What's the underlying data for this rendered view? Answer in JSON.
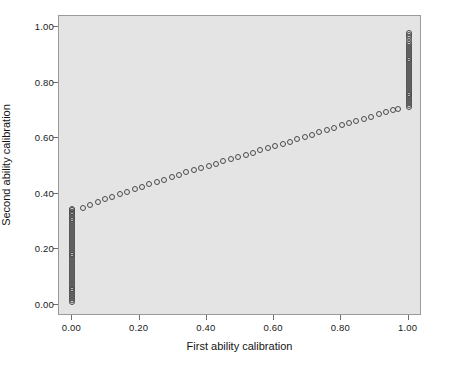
{
  "chart_data": {
    "type": "scatter",
    "title": "",
    "xlabel": "First ability calibration",
    "ylabel": "Second ability calibration",
    "xlim": [
      -0.04,
      1.04
    ],
    "ylim": [
      -0.04,
      1.04
    ],
    "xticks": [
      "0.00",
      "0.20",
      "0.40",
      "0.60",
      "0.80",
      "1.00"
    ],
    "xtick_values": [
      0.0,
      0.2,
      0.4,
      0.6,
      0.8,
      1.0
    ],
    "yticks": [
      "0.00",
      "0.20",
      "0.40",
      "0.60",
      "0.80",
      "1.00"
    ],
    "ytick_values": [
      0.0,
      0.2,
      0.4,
      0.6,
      0.8,
      1.0
    ],
    "grid": false,
    "legend": null,
    "marker": "open-circle",
    "marker_color": "#4a4a4a",
    "plot_background": "#e4e4e4",
    "page_background": "#ffffff",
    "border_color": "#9a9a9a",
    "series": [
      {
        "name": "Left floor cluster",
        "comment": "dense vertical column of examinees pinned at x = 0.00",
        "x": [
          0.0,
          0.0,
          0.0,
          0.0,
          0.0,
          0.0,
          0.0,
          0.0,
          0.0,
          0.0,
          0.0,
          0.0,
          0.0,
          0.0,
          0.0,
          0.0,
          0.0,
          0.0,
          0.0,
          0.0,
          0.0,
          0.0,
          0.0,
          0.0,
          0.0,
          0.0,
          0.0,
          0.0,
          0.0,
          0.0,
          0.0,
          0.0,
          0.0,
          0.0,
          0.0,
          0.0,
          0.0,
          0.0,
          0.0,
          0.0,
          0.0,
          0.0,
          0.0,
          0.0,
          0.0,
          0.0,
          0.0,
          0.0,
          0.0,
          0.0
        ],
        "y": [
          0.01,
          0.017,
          0.024,
          0.031,
          0.038,
          0.045,
          0.052,
          0.059,
          0.066,
          0.073,
          0.08,
          0.087,
          0.094,
          0.101,
          0.108,
          0.115,
          0.122,
          0.129,
          0.136,
          0.143,
          0.15,
          0.157,
          0.164,
          0.171,
          0.178,
          0.185,
          0.192,
          0.199,
          0.206,
          0.213,
          0.22,
          0.227,
          0.234,
          0.241,
          0.248,
          0.255,
          0.262,
          0.269,
          0.276,
          0.283,
          0.29,
          0.297,
          0.304,
          0.311,
          0.318,
          0.325,
          0.33,
          0.335,
          0.34,
          0.345
        ]
      },
      {
        "name": "Central diagonal band",
        "comment": "monotone rising trace of matched calibrations",
        "x": [
          0.03,
          0.053,
          0.075,
          0.097,
          0.119,
          0.141,
          0.163,
          0.185,
          0.207,
          0.229,
          0.251,
          0.273,
          0.295,
          0.317,
          0.339,
          0.361,
          0.383,
          0.405,
          0.427,
          0.449,
          0.471,
          0.493,
          0.515,
          0.537,
          0.559,
          0.581,
          0.603,
          0.625,
          0.647,
          0.669,
          0.691,
          0.713,
          0.735,
          0.757,
          0.779,
          0.801,
          0.823,
          0.845,
          0.867,
          0.889,
          0.911,
          0.933,
          0.955,
          0.97
        ],
        "y": [
          0.35,
          0.36,
          0.37,
          0.38,
          0.39,
          0.399,
          0.408,
          0.417,
          0.426,
          0.434,
          0.443,
          0.451,
          0.46,
          0.468,
          0.477,
          0.485,
          0.493,
          0.501,
          0.509,
          0.517,
          0.524,
          0.532,
          0.54,
          0.548,
          0.556,
          0.564,
          0.572,
          0.58,
          0.588,
          0.597,
          0.605,
          0.613,
          0.621,
          0.629,
          0.637,
          0.646,
          0.654,
          0.662,
          0.67,
          0.678,
          0.686,
          0.694,
          0.702,
          0.706
        ]
      },
      {
        "name": "Right ceiling cluster",
        "comment": "dense vertical column of examinees pinned at x = 1.00",
        "x": [
          1.0,
          1.0,
          1.0,
          1.0,
          1.0,
          1.0,
          1.0,
          1.0,
          1.0,
          1.0,
          1.0,
          1.0,
          1.0,
          1.0,
          1.0,
          1.0,
          1.0,
          1.0,
          1.0,
          1.0,
          1.0,
          1.0,
          1.0,
          1.0,
          1.0,
          1.0,
          1.0,
          1.0,
          1.0,
          1.0,
          1.0,
          1.0,
          1.0,
          1.0,
          1.0,
          1.0,
          1.0,
          1.0
        ],
        "y": [
          0.712,
          0.719,
          0.726,
          0.733,
          0.74,
          0.747,
          0.754,
          0.761,
          0.768,
          0.775,
          0.782,
          0.789,
          0.796,
          0.803,
          0.81,
          0.817,
          0.824,
          0.831,
          0.838,
          0.845,
          0.852,
          0.859,
          0.866,
          0.873,
          0.88,
          0.887,
          0.894,
          0.901,
          0.908,
          0.915,
          0.922,
          0.929,
          0.936,
          0.943,
          0.955,
          0.965,
          0.973,
          0.98
        ]
      }
    ]
  }
}
